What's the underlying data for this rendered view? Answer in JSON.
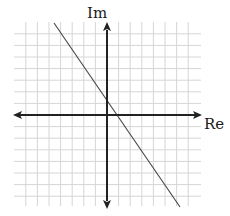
{
  "diagram": {
    "type": "complex-plane",
    "axes": {
      "imaginary_label": "Im",
      "real_label": "Re"
    },
    "grid": {
      "spacing_px": 11.6,
      "cells_left_of_origin": 8,
      "cells_right_of_origin": 8,
      "cells_above_origin": 7,
      "cells_below_origin": 7,
      "color": "#d6d6d6"
    },
    "line": {
      "description": "straight line with negative slope crossing Im axis slightly above origin and Re axis slightly right of origin",
      "color": "#444444"
    },
    "colors": {
      "axis": "#222222",
      "background": "#ffffff"
    }
  }
}
